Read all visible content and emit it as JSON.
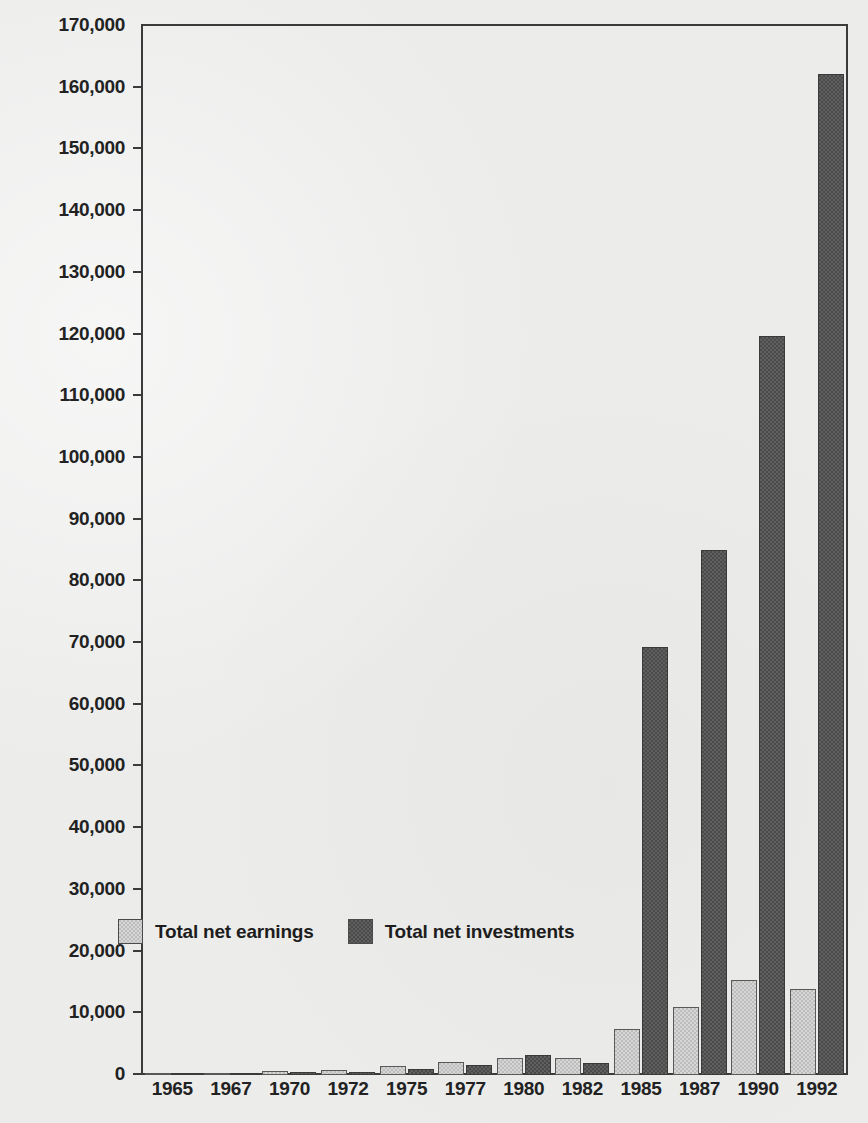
{
  "chart_data": {
    "type": "bar",
    "title": "",
    "subtitle": "",
    "xlabel": "",
    "ylabel": "£ million",
    "ylim": [
      0,
      170000
    ],
    "ytick_step": 10000,
    "grid": false,
    "legend_position": "inside-bottom-left",
    "categories": [
      "1965",
      "1967",
      "1970",
      "1972",
      "1975",
      "1977",
      "1980",
      "1982",
      "1985",
      "1987",
      "1990",
      "1992"
    ],
    "ytick_labels": [
      "170,000",
      "160,000",
      "150,000",
      "140,000",
      "130,000",
      "120,000",
      "110,000",
      "100,000",
      "90,000",
      "80,000",
      "70,000",
      "60,000",
      "50,000",
      "40,000",
      "30,000",
      "20,000",
      "10,000",
      "0"
    ],
    "series": [
      {
        "name": "Total net earnings",
        "color": "#bdbdbd",
        "values": [
          300,
          350,
          600,
          750,
          1400,
          2100,
          2700,
          2750,
          7500,
          11000,
          15500,
          14000
        ]
      },
      {
        "name": "Total net investments",
        "color": "#4a4a4a",
        "values": [
          200,
          250,
          450,
          550,
          900,
          1700,
          3300,
          1900,
          69500,
          85200,
          120000,
          162500
        ]
      }
    ]
  },
  "legend": {
    "items": [
      {
        "label": "Total net earnings",
        "swatch": "light-swatch-icon"
      },
      {
        "label": "Total net investments",
        "swatch": "dark-swatch-icon"
      }
    ]
  },
  "axis": {
    "y_title": "£ million"
  },
  "colors": {
    "background": "#ececeb",
    "axis_line": "#3b3b3b",
    "text": "#222222",
    "series_light": "#bdbdbd",
    "series_dark": "#4a4a4a"
  }
}
